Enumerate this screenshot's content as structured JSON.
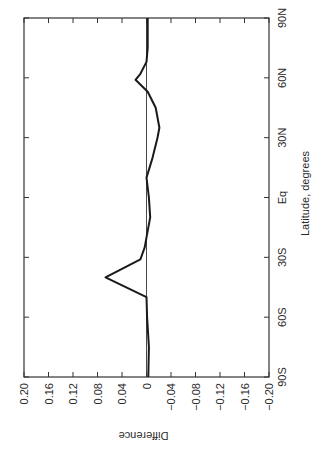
{
  "chart_data": {
    "type": "line",
    "orientation_note": "figure rotated 90 degrees counter-clockwise",
    "title": "",
    "xlabel": "Latitude, degrees",
    "ylabel": "Difference",
    "x_ticks": [
      "90N",
      "60N",
      "30N",
      "Eq",
      "30S",
      "60S",
      "90S"
    ],
    "y_ticks": [
      "0.20",
      "0.16",
      "0.12",
      "0.08",
      "0.04",
      "0",
      "−0.04",
      "−0.08",
      "−0.12",
      "−0.16",
      "−0.20"
    ],
    "xlim": [
      90,
      -90
    ],
    "ylim": [
      -0.2,
      0.2
    ],
    "zero_line": true,
    "grid": false,
    "series": [
      {
        "name": "Difference",
        "x": [
          90,
          75,
          68,
          62,
          59,
          53,
          45,
          35,
          30,
          20,
          10,
          0,
          -10,
          -20,
          -25,
          -31,
          -40,
          -50,
          -60,
          -75,
          -90
        ],
        "values": [
          -0.002,
          -0.002,
          0.0,
          0.01,
          0.018,
          -0.002,
          -0.015,
          -0.021,
          -0.018,
          -0.01,
          0.0,
          -0.004,
          -0.006,
          0.0,
          0.003,
          0.01,
          0.067,
          0.0,
          -0.001,
          -0.004,
          -0.003
        ]
      }
    ]
  },
  "colors": {
    "line": "#1a1a1a",
    "axis": "#333333",
    "background": "#ffffff"
  }
}
